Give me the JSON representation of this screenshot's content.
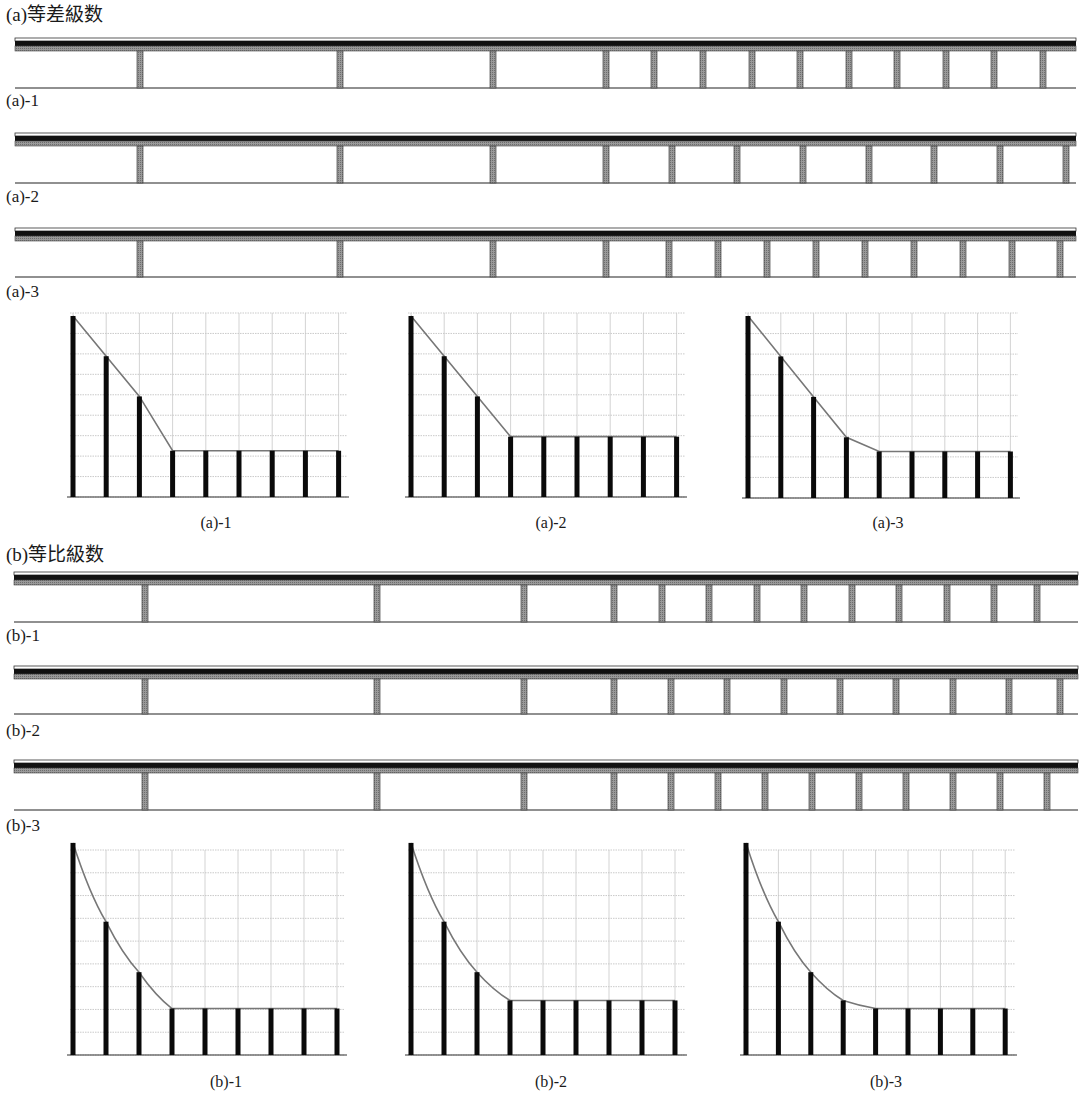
{
  "sections": [
    {
      "id": "a",
      "heading": "(a)等差級数",
      "bridges": [
        {
          "label": "(a)-1",
          "pillars": [
            140,
            340,
            493,
            606,
            654,
            703,
            752,
            800,
            849,
            897,
            946,
            994,
            1043
          ]
        },
        {
          "label": "(a)-2",
          "pillars": [
            140,
            340,
            493,
            606,
            672,
            737,
            803,
            869,
            934,
            1000,
            1066
          ]
        },
        {
          "label": "(a)-3",
          "pillars": [
            140,
            340,
            493,
            606,
            669,
            718,
            767,
            816,
            865,
            914,
            963,
            1012,
            1060
          ]
        }
      ]
    },
    {
      "id": "b",
      "heading": "(b)等比級数",
      "bridges": [
        {
          "label": "(b)-1",
          "pillars": [
            145,
            377,
            524,
            614,
            662,
            709,
            757,
            804,
            852,
            899,
            947,
            994,
            1037
          ]
        },
        {
          "label": "(b)-2",
          "pillars": [
            145,
            377,
            524,
            614,
            671,
            727,
            784,
            840,
            896,
            953,
            1009,
            1060
          ]
        },
        {
          "label": "(b)-3",
          "pillars": [
            145,
            377,
            524,
            614,
            671,
            718,
            765,
            812,
            859,
            906,
            953,
            1000,
            1047
          ]
        }
      ]
    }
  ],
  "chart_data": [
    {
      "type": "bar",
      "title": "(a)-1",
      "categories": [
        1,
        2,
        3,
        4,
        5,
        6,
        7,
        8,
        9
      ],
      "values": [
        9,
        7,
        5,
        2.3,
        2.3,
        2.3,
        2.3,
        2.3,
        2.3
      ],
      "ylim": [
        0,
        9
      ],
      "grid": true,
      "envelope": "linear"
    },
    {
      "type": "bar",
      "title": "(a)-2",
      "categories": [
        1,
        2,
        3,
        4,
        5,
        6,
        7,
        8,
        9
      ],
      "values": [
        9,
        7,
        5,
        3,
        3,
        3,
        3,
        3,
        3
      ],
      "ylim": [
        0,
        9
      ],
      "grid": true,
      "envelope": "linear"
    },
    {
      "type": "bar",
      "title": "(a)-3",
      "categories": [
        1,
        2,
        3,
        4,
        5,
        6,
        7,
        8,
        9
      ],
      "values": [
        9,
        7,
        5,
        3,
        2.3,
        2.3,
        2.3,
        2.3,
        2.3
      ],
      "ylim": [
        0,
        9
      ],
      "grid": true,
      "envelope": "linear"
    },
    {
      "type": "bar",
      "title": "(b)-1",
      "categories": [
        1,
        2,
        3,
        4,
        5,
        6,
        7,
        8,
        9
      ],
      "values": [
        10.5,
        6.6,
        4.1,
        2.3,
        2.3,
        2.3,
        2.3,
        2.3,
        2.3
      ],
      "ylim": [
        0,
        10
      ],
      "grid": true,
      "envelope": "geometric"
    },
    {
      "type": "bar",
      "title": "(b)-2",
      "categories": [
        1,
        2,
        3,
        4,
        5,
        6,
        7,
        8,
        9
      ],
      "values": [
        10.5,
        6.6,
        4.1,
        2.7,
        2.7,
        2.7,
        2.7,
        2.7,
        2.7
      ],
      "ylim": [
        0,
        10
      ],
      "grid": true,
      "envelope": "geometric"
    },
    {
      "type": "bar",
      "title": "(b)-3",
      "categories": [
        1,
        2,
        3,
        4,
        5,
        6,
        7,
        8,
        9
      ],
      "values": [
        10.5,
        6.6,
        4.1,
        2.7,
        2.3,
        2.3,
        2.3,
        2.3,
        2.3
      ],
      "ylim": [
        0,
        10
      ],
      "grid": true,
      "envelope": "geometric"
    }
  ]
}
